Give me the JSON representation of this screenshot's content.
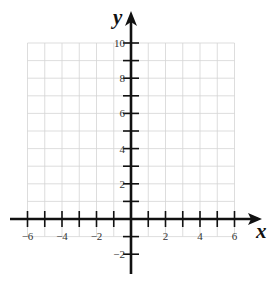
{
  "figure": {
    "type": "coordinate-plane",
    "x_axis": {
      "label": "x",
      "min": -6,
      "max": 6,
      "labeled_ticks": [
        -6,
        -4,
        -2,
        2,
        4,
        6
      ],
      "tick_step": 1
    },
    "y_axis": {
      "label": "y",
      "min": -2,
      "max": 10,
      "labeled_ticks": [
        -2,
        2,
        4,
        6,
        8,
        10
      ],
      "tick_step": 1
    },
    "grid": {
      "x_range": [
        -6,
        6
      ],
      "y_range": [
        -1,
        10
      ],
      "step": 1,
      "color": "#d4d4d4"
    },
    "colors": {
      "axis": "#111111",
      "background": "#ffffff"
    }
  }
}
